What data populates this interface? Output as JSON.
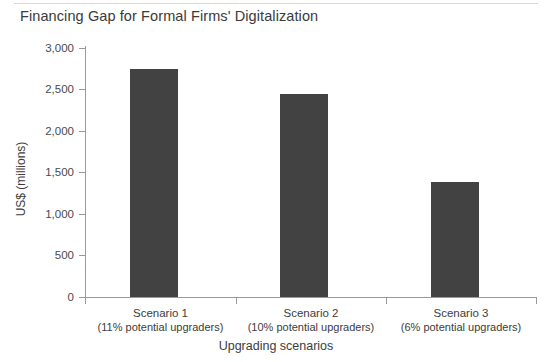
{
  "chart_data": {
    "type": "bar",
    "title": "Financing Gap for Formal Firms' Digitalization",
    "xlabel": "Upgrading scenarios",
    "ylabel": "US$ (millions)",
    "categories": [
      "Scenario 1",
      "Scenario 2",
      "Scenario 3"
    ],
    "category_sublabels": [
      "(11% potential upgraders)",
      "(10% potential upgraders)",
      "(6% potential upgraders)"
    ],
    "values": [
      2750,
      2440,
      1380
    ],
    "ylim": [
      0,
      3000
    ],
    "ytick_labels": [
      "3,000",
      "2,500",
      "2,000",
      "1,500",
      "1,000",
      "500",
      "0"
    ],
    "ytick_values": [
      3000,
      2500,
      2000,
      1500,
      1000,
      500,
      0
    ],
    "grid": false,
    "legend": "none",
    "bar_color": "#424242",
    "axis_color": "#9a9a9a"
  }
}
